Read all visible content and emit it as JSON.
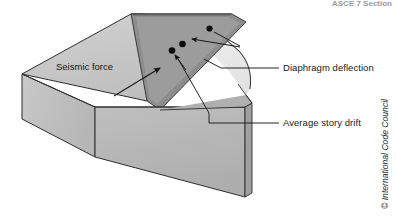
{
  "figure": {
    "header_fragment": "ASCE 7 Section",
    "credit": "© International Code Council",
    "width": 398,
    "height": 217
  },
  "labels": {
    "seismic_force": "Seismic force",
    "diaphragm_deflection": "Diaphragm deflection",
    "average_story_drift": "Average story drift"
  },
  "icons": {
    "seismic_arrow": "arrow-up-right-icon",
    "leader_arrow_upper": "leader-arrow-icon",
    "leader_arrow_lower": "leader-arrow-icon",
    "marker_dot": "dot-marker-icon"
  },
  "markers": [
    {
      "name": "deflected-edge-point",
      "x": 209.5,
      "y": 28.5,
      "r": 3.1
    },
    {
      "name": "diaphragm-midspan-point",
      "x": 182.5,
      "y": 44.0,
      "r": 3.1
    },
    {
      "name": "wall-top-point",
      "x": 172.0,
      "y": 50.5,
      "r": 3.1
    }
  ],
  "colors": {
    "background": "#ffffff",
    "roof_top": "#c9c9c9",
    "roof_top_light": "#d6d6d6",
    "fascia_dark": "#8a8a8a",
    "fascia_mid": "#a8a8a8",
    "wall_left": "#c2c2c2",
    "wall_front": "#b8b8b8",
    "wall_front_shade": "#ababab",
    "deflect_region": "#ededed",
    "outline": "#2e2e2e",
    "leader": "#1a1a1a",
    "marker": "#0d0d0d",
    "text": "#1a1a1a",
    "credit": "#2b2b2b",
    "header": "#9a9a9a"
  },
  "geometry": {
    "roof_top_polygon": "22,74 131,14 232,14 147,101",
    "roof_front_band": "147,101 232,14 246,22 160,110",
    "wall_left_polygon": "22,74 22,119 94,156 94,106",
    "wall_front_polygon": "94,156 94,106 245,106 245,196",
    "deflection_arc_fill": "131,14 232,14 246,22 250,34 250,52 244,68 232,81 216,91 201,97",
    "deflected_edge_path": "M 131,14 C 175,13 215,27 238,50 C 248,61 251,74 250,88"
  },
  "leaders": {
    "diaphragm_deflection_line": "M 279,68 L 220,68 L 203,59",
    "diaphragm_arrow_1": "M 209.5,28.5 L 243,46",
    "diaphragm_arrow_2": "M 243,46 L 186,42",
    "story_drift_line": "M 279,122 L 208,122 L 208,112 L 176,55",
    "story_drift_branch": "M 186,48 L 172,53"
  }
}
